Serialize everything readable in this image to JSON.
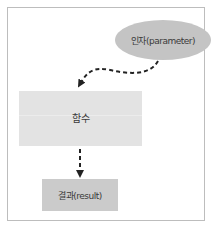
{
  "diagram": {
    "parameter": {
      "label": "인자(parameter)",
      "color": "#c4c4c4"
    },
    "function": {
      "label": "함수",
      "color": "#e3e3e3"
    },
    "result": {
      "label": "결과(result)",
      "color": "#cbcbcb"
    },
    "arrows": [
      {
        "from": "parameter",
        "to": "function",
        "style": "dashed-curved"
      },
      {
        "from": "function",
        "to": "result",
        "style": "dashed-straight"
      }
    ],
    "frame_color": "#bdbdbd",
    "arrow_color": "#222222"
  }
}
